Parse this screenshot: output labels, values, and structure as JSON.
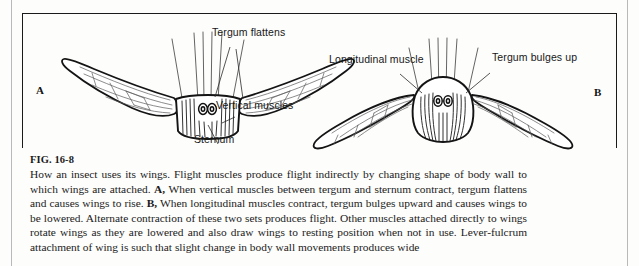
{
  "figure": {
    "number": "FIG. 16-8",
    "caption": "How an insect uses its wings. Flight muscles produce flight indirectly by changing shape of body wall to which wings are attached. A, When vertical muscles between tergum and sternum contract, tergum flattens and causes wings to rise. B, When longitudinal muscles contract, tergum bulges upward and causes wings to be lowered. Alternate contraction of these two sets produces flight. Other muscles attached directly to wings rotate wings as they are lowered and also draw wings to resting position when not in use. Lever-fulcrum attachment of wing is such that slight change in body wall movements produces wide",
    "caption_segments": [
      {
        "text": "How an insect uses its wings. Flight muscles produce flight indirectly by changing shape of body wall to which wings are attached. ",
        "bold": false
      },
      {
        "text": "A,",
        "bold": true
      },
      {
        "text": " When vertical muscles between tergum and sternum contract, tergum flattens and causes wings to rise. ",
        "bold": false
      },
      {
        "text": "B,",
        "bold": true
      },
      {
        "text": " When longitudinal muscles contract, tergum bulges upward and causes wings to be lowered. Alternate contraction of these two sets produces flight. Other muscles attached directly to wings rotate wings as they are lowered and also draw wings to resting position when not in use. Lever-fulcrum attachment of wing is such that slight change in body wall movements produces wide",
        "bold": false
      }
    ]
  },
  "panels": [
    {
      "letter": "A",
      "state": "wings raised",
      "labels": [
        {
          "id": "tergum-flattens",
          "text": "Tergum flattens"
        },
        {
          "id": "vertical-muscles",
          "text": "Vertical muscles"
        },
        {
          "id": "sternum",
          "text": "Sternum"
        }
      ]
    },
    {
      "letter": "B",
      "state": "wings lowered",
      "labels": [
        {
          "id": "longitudinal-muscle",
          "text": "Longitudinal muscle"
        },
        {
          "id": "tergum-bulges-up",
          "text": "Tergum bulges up"
        }
      ]
    }
  ],
  "colors": {
    "ink": "#1a1a1a",
    "page": "#fdfdfc",
    "rule": "#b9b9b9",
    "vein": "#4a4a4a"
  }
}
